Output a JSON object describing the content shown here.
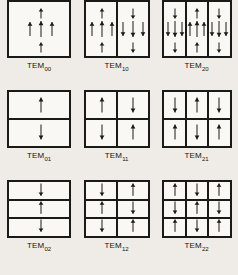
{
  "figure": {
    "background_color": "#efece7",
    "ink_color": "#1a1a18",
    "panel_fill": "#faf8f4"
  },
  "modes": [
    {
      "id": "TEM00",
      "label_base": "TEM",
      "label_sub": "00",
      "cols": 1,
      "rows": 1,
      "cluster": "full",
      "lobes": [
        {
          "row": 0,
          "col": 0,
          "direction": "up"
        }
      ]
    },
    {
      "id": "TEM10",
      "label_base": "TEM",
      "label_sub": "10",
      "cols": 2,
      "rows": 1,
      "cluster": "full",
      "lobes": [
        {
          "row": 0,
          "col": 0,
          "direction": "up"
        },
        {
          "row": 0,
          "col": 1,
          "direction": "down"
        }
      ]
    },
    {
      "id": "TEM20",
      "label_base": "TEM",
      "label_sub": "20",
      "cols": 3,
      "rows": 1,
      "cluster": "full",
      "lobes": [
        {
          "row": 0,
          "col": 0,
          "direction": "down"
        },
        {
          "row": 0,
          "col": 1,
          "direction": "up"
        },
        {
          "row": 0,
          "col": 2,
          "direction": "down"
        }
      ]
    },
    {
      "id": "TEM01",
      "label_base": "TEM",
      "label_sub": "01",
      "cols": 1,
      "rows": 2,
      "cluster": "single",
      "lobes": [
        {
          "row": 0,
          "col": 0,
          "direction": "up"
        },
        {
          "row": 1,
          "col": 0,
          "direction": "down"
        }
      ]
    },
    {
      "id": "TEM11",
      "label_base": "TEM",
      "label_sub": "11",
      "cols": 2,
      "rows": 2,
      "cluster": "single",
      "lobes": [
        {
          "row": 0,
          "col": 0,
          "direction": "up"
        },
        {
          "row": 0,
          "col": 1,
          "direction": "down"
        },
        {
          "row": 1,
          "col": 0,
          "direction": "down"
        },
        {
          "row": 1,
          "col": 1,
          "direction": "up"
        }
      ]
    },
    {
      "id": "TEM21",
      "label_base": "TEM",
      "label_sub": "21",
      "cols": 3,
      "rows": 2,
      "cluster": "single",
      "lobes": [
        {
          "row": 0,
          "col": 0,
          "direction": "down"
        },
        {
          "row": 0,
          "col": 1,
          "direction": "up"
        },
        {
          "row": 0,
          "col": 2,
          "direction": "down"
        },
        {
          "row": 1,
          "col": 0,
          "direction": "up"
        },
        {
          "row": 1,
          "col": 1,
          "direction": "down"
        },
        {
          "row": 1,
          "col": 2,
          "direction": "up"
        }
      ]
    },
    {
      "id": "TEM02",
      "label_base": "TEM",
      "label_sub": "02",
      "cols": 1,
      "rows": 3,
      "cluster": "single",
      "lobes": [
        {
          "row": 0,
          "col": 0,
          "direction": "down"
        },
        {
          "row": 1,
          "col": 0,
          "direction": "up"
        },
        {
          "row": 2,
          "col": 0,
          "direction": "down"
        }
      ]
    },
    {
      "id": "TEM12",
      "label_base": "TEM",
      "label_sub": "12",
      "cols": 2,
      "rows": 3,
      "cluster": "single",
      "lobes": [
        {
          "row": 0,
          "col": 0,
          "direction": "down"
        },
        {
          "row": 0,
          "col": 1,
          "direction": "up"
        },
        {
          "row": 1,
          "col": 0,
          "direction": "up"
        },
        {
          "row": 1,
          "col": 1,
          "direction": "down"
        },
        {
          "row": 2,
          "col": 0,
          "direction": "down"
        },
        {
          "row": 2,
          "col": 1,
          "direction": "up"
        }
      ]
    },
    {
      "id": "TEM22",
      "label_base": "TEM",
      "label_sub": "22",
      "cols": 3,
      "rows": 3,
      "cluster": "single",
      "lobes": [
        {
          "row": 0,
          "col": 0,
          "direction": "up"
        },
        {
          "row": 0,
          "col": 1,
          "direction": "down"
        },
        {
          "row": 0,
          "col": 2,
          "direction": "up"
        },
        {
          "row": 1,
          "col": 0,
          "direction": "down"
        },
        {
          "row": 1,
          "col": 1,
          "direction": "up"
        },
        {
          "row": 1,
          "col": 2,
          "direction": "down"
        },
        {
          "row": 2,
          "col": 0,
          "direction": "up"
        },
        {
          "row": 2,
          "col": 1,
          "direction": "down"
        },
        {
          "row": 2,
          "col": 2,
          "direction": "up"
        }
      ]
    }
  ]
}
